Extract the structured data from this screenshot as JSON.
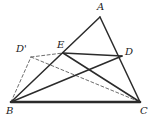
{
  "figure": {
    "width": 152,
    "height": 122,
    "background_color": "#ffffff",
    "stroke_color": "#2b2b2b",
    "dashed_stroke_color": "#6e6e6e",
    "label_color": "#222222"
  },
  "points": {
    "A": {
      "label": "A",
      "x": 100,
      "y": 17,
      "label_x": 97,
      "label_y": 2
    },
    "B": {
      "label": "B",
      "x": 11,
      "y": 102,
      "label_x": 6,
      "label_y": 106
    },
    "C": {
      "label": "C",
      "x": 140,
      "y": 102,
      "label_x": 140,
      "label_y": 106
    },
    "D": {
      "label": "D",
      "x": 122,
      "y": 56,
      "label_x": 125,
      "label_y": 47
    },
    "E": {
      "label": "E",
      "x": 63,
      "y": 53,
      "label_x": 57,
      "label_y": 40
    },
    "Dprime": {
      "label": "D'",
      "x": 31,
      "y": 57,
      "label_x": 16,
      "label_y": 44
    }
  },
  "segments": {
    "solid": [
      {
        "name": "segment-AB",
        "from": "A",
        "to": "B",
        "width": 1.5
      },
      {
        "name": "segment-AC",
        "from": "A",
        "to": "C",
        "width": 1.5
      },
      {
        "name": "segment-BC",
        "from": "B",
        "to": "C",
        "width": 2.6
      },
      {
        "name": "segment-BD",
        "from": "B",
        "to": "D",
        "width": 1.5
      },
      {
        "name": "segment-CE",
        "from": "C",
        "to": "E",
        "width": 1.5
      },
      {
        "name": "segment-ED",
        "from": "E",
        "to": "D",
        "width": 1.5
      }
    ],
    "dashed": [
      {
        "name": "segment-B-Dprime",
        "from": "B",
        "to": "Dprime",
        "width": 1.0
      },
      {
        "name": "segment-Dprime-E",
        "from": "Dprime",
        "to": "E",
        "width": 1.0
      },
      {
        "name": "segment-Dprime-C",
        "from": "Dprime",
        "to": "C",
        "width": 1.0
      }
    ]
  }
}
